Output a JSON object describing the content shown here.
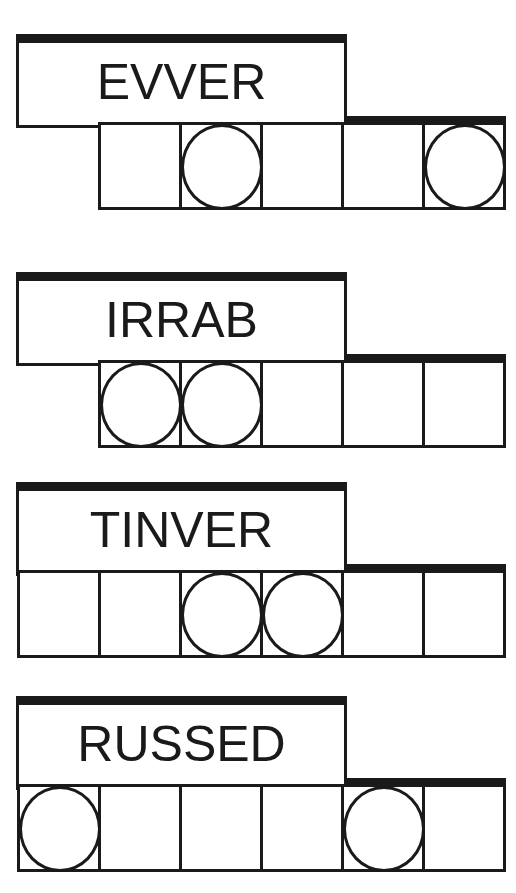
{
  "puzzles": [
    {
      "clue": "EVVER",
      "top": 34,
      "cells_left": 98,
      "cell_count": 5,
      "circled": [
        1,
        4
      ]
    },
    {
      "clue": "IRRAB",
      "top": 272,
      "cells_left": 98,
      "cell_count": 5,
      "circled": [
        0,
        1
      ]
    },
    {
      "clue": "TINVER",
      "top": 482,
      "cells_left": 17,
      "cell_count": 6,
      "circled": [
        2,
        3
      ]
    },
    {
      "clue": "RUSSED",
      "top": 696,
      "cells_left": 17,
      "cell_count": 6,
      "circled": [
        0,
        4
      ]
    }
  ],
  "colors": {
    "ink": "#1a1a1a",
    "background": "#ffffff"
  }
}
